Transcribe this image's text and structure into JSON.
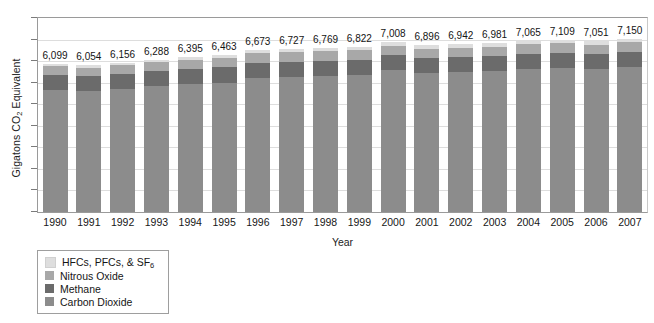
{
  "chart_data": {
    "type": "bar",
    "subtype": "stacked-bar",
    "title": "",
    "xlabel": "Year",
    "ylabel": "Gigatons CO2 Equivalent",
    "ylabel_display": "Gigatons CO",
    "ylabel_sub": "2",
    "ylabel_tail": " Equivalent",
    "grid": true,
    "gridline_count": 8,
    "y_tick_labels_shown": false,
    "ylim": [
      0,
      8000
    ],
    "legend_position": "below-left",
    "categories": [
      "1990",
      "1991",
      "1992",
      "1993",
      "1994",
      "1995",
      "1996",
      "1997",
      "1998",
      "1999",
      "2000",
      "2001",
      "2002",
      "2003",
      "2004",
      "2005",
      "2006",
      "2007"
    ],
    "totals": [
      6099,
      6054,
      6156,
      6288,
      6395,
      6463,
      6673,
      6727,
      6769,
      6822,
      7008,
      6896,
      6942,
      6981,
      7065,
      7109,
      7051,
      7150
    ],
    "total_labels": [
      "6,099",
      "6,054",
      "6,156",
      "6,288",
      "6,395",
      "6,463",
      "6,673",
      "6,727",
      "6,769",
      "6,822",
      "7,008",
      "6,896",
      "6,942",
      "6,981",
      "7,065",
      "7,109",
      "7,051",
      "7,150"
    ],
    "series": [
      {
        "name": "Carbon Dioxide",
        "color": "#8c8c8c",
        "values": [
          5020,
          4985,
          5075,
          5185,
          5275,
          5330,
          5520,
          5570,
          5610,
          5660,
          5840,
          5730,
          5775,
          5820,
          5905,
          5955,
          5900,
          6000
        ]
      },
      {
        "name": "Methane",
        "color": "#6b6b6b",
        "values": [
          640,
          630,
          630,
          630,
          630,
          630,
          630,
          630,
          625,
          620,
          615,
          610,
          610,
          605,
          605,
          600,
          600,
          600
        ]
      },
      {
        "name": "Nitrous Oxide",
        "color": "#a8a8a8",
        "values": [
          345,
          345,
          345,
          360,
          375,
          385,
          395,
          400,
          400,
          400,
          400,
          400,
          400,
          400,
          400,
          400,
          395,
          395
        ]
      },
      {
        "name": "HFCs, PFCs, & SF6",
        "color": "#dedede",
        "values": [
          94,
          94,
          106,
          113,
          115,
          118,
          128,
          127,
          134,
          142,
          153,
          156,
          157,
          156,
          155,
          154,
          156,
          155
        ]
      }
    ]
  },
  "legend": {
    "items": [
      {
        "label": "HFCs, PFCs, & SF",
        "subscript": "6",
        "color": "#dedede"
      },
      {
        "label": "Nitrous Oxide",
        "subscript": "",
        "color": "#a8a8a8"
      },
      {
        "label": "Methane",
        "subscript": "",
        "color": "#6b6b6b"
      },
      {
        "label": "Carbon Dioxide",
        "subscript": "",
        "color": "#8c8c8c"
      }
    ]
  },
  "axes": {
    "x_title": "Year",
    "frame_color": "#9a9a9a",
    "grid_color": "#dddddd"
  }
}
